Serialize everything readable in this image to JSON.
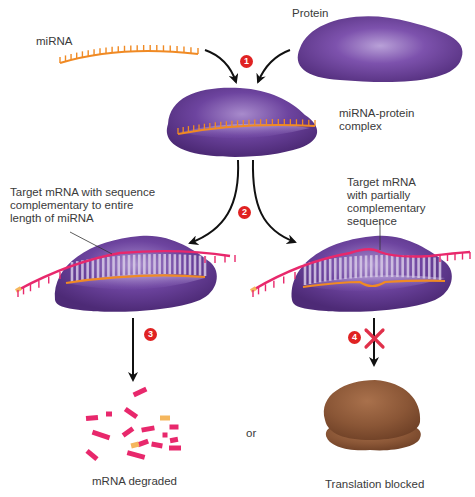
{
  "labels": {
    "mirna": "miRNA",
    "protein": "Protein",
    "complex": "miRNA-protein\ncomplex",
    "target_full": "Target mRNA with sequence\ncomplementary to entire\nlength of miRNA",
    "target_partial": "Target mRNA\nwith partially\ncomplementary\nsequence",
    "degraded": "mRNA degraded",
    "or": "or",
    "blocked": "Translation blocked"
  },
  "steps": [
    "1",
    "2",
    "3",
    "4"
  ],
  "colors": {
    "protein": "#6b3f98",
    "protein_light": "#a98ccd",
    "mirna": "#f08a24",
    "mrna": "#e8286c",
    "mrna_cap": "#f5b75e",
    "ribosome": "#8a5636",
    "step_badge": "#e02222",
    "block_x": "#e0304a",
    "arrow": "#111111"
  }
}
